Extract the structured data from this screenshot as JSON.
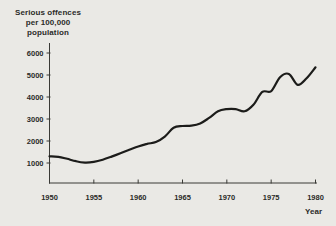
{
  "chart_data": {
    "type": "line",
    "title": "Serious offences per 100,000 population",
    "ylabel_lines": [
      "Serious offences",
      "per 100,000",
      "population"
    ],
    "xlabel": "Year",
    "x": [
      1950,
      1951,
      1952,
      1953,
      1954,
      1955,
      1956,
      1957,
      1958,
      1959,
      1960,
      1961,
      1962,
      1963,
      1964,
      1965,
      1966,
      1967,
      1968,
      1969,
      1970,
      1971,
      1972,
      1973,
      1974,
      1975,
      1976,
      1977,
      1978,
      1979,
      1980
    ],
    "values": [
      1300,
      1280,
      1190,
      1080,
      1020,
      1050,
      1150,
      1290,
      1440,
      1600,
      1750,
      1870,
      1950,
      2200,
      2600,
      2680,
      2700,
      2800,
      3050,
      3350,
      3450,
      3450,
      3350,
      3650,
      4230,
      4270,
      4900,
      5050,
      4550,
      4850,
      5350
    ],
    "xticks": [
      1950,
      1955,
      1960,
      1965,
      1970,
      1975,
      1980
    ],
    "yticks": [
      1000,
      2000,
      3000,
      4000,
      5000,
      6000
    ],
    "xlim": [
      1950,
      1980
    ],
    "ylim": [
      1000,
      6000
    ],
    "grid": false,
    "legend": "none",
    "colors": {
      "line": "#1c1c1a",
      "axis": "#3a3a36",
      "text": "#2b2b28",
      "background": "#eae9e5"
    }
  }
}
